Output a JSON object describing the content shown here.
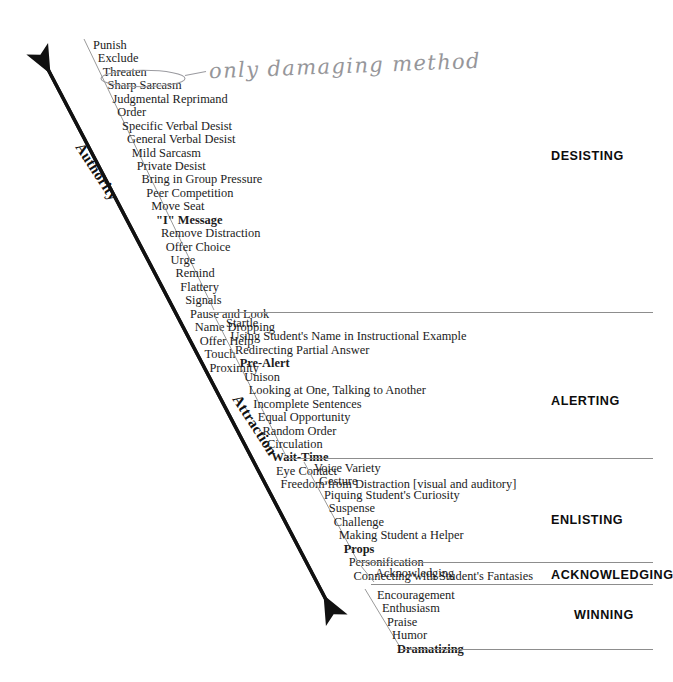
{
  "axis": {
    "top_label": "Authority",
    "bottom_label": "Attraction"
  },
  "annotation": {
    "text": "only damaging method",
    "circled_item": "Sharp Sarcasm"
  },
  "sections": [
    {
      "id": "desisting",
      "category": "DESISTING",
      "items": [
        {
          "label": "Punish",
          "bold": false
        },
        {
          "label": "Exclude",
          "bold": false
        },
        {
          "label": "Threaten",
          "bold": false
        },
        {
          "label": "Sharp Sarcasm",
          "bold": false
        },
        {
          "label": "Judgmental Reprimand",
          "bold": false
        },
        {
          "label": "Order",
          "bold": false
        },
        {
          "label": "Specific Verbal Desist",
          "bold": false
        },
        {
          "label": "General Verbal Desist",
          "bold": false
        },
        {
          "label": "Mild Sarcasm",
          "bold": false
        },
        {
          "label": "Private Desist",
          "bold": false
        },
        {
          "label": "Bring in Group Pressure",
          "bold": false
        },
        {
          "label": "Peer Competition",
          "bold": false
        },
        {
          "label": "Move Seat",
          "bold": false
        },
        {
          "label": "\"I\" Message",
          "bold": true
        },
        {
          "label": "Remove Distraction",
          "bold": false
        },
        {
          "label": "Offer Choice",
          "bold": false
        },
        {
          "label": "Urge",
          "bold": false
        },
        {
          "label": "Remind",
          "bold": false
        },
        {
          "label": "Flattery",
          "bold": false
        },
        {
          "label": "Signals",
          "bold": false
        },
        {
          "label": "Pause and Look",
          "bold": false
        },
        {
          "label": "Name Dropping",
          "bold": false
        },
        {
          "label": "Offer Help",
          "bold": false
        },
        {
          "label": "Touch",
          "bold": false
        },
        {
          "label": "Proximity",
          "bold": false
        }
      ]
    },
    {
      "id": "alerting",
      "category": "ALERTING",
      "items": [
        {
          "label": "Startle",
          "bold": false
        },
        {
          "label": "Using Student's Name in Instructional Example",
          "bold": false
        },
        {
          "label": "Redirecting Partial Answer",
          "bold": false
        },
        {
          "label": "Pre-Alert",
          "bold": true
        },
        {
          "label": "Unison",
          "bold": false
        },
        {
          "label": "Looking at One, Talking to Another",
          "bold": false
        },
        {
          "label": "Incomplete Sentences",
          "bold": false
        },
        {
          "label": "Equal Opportunity",
          "bold": false
        },
        {
          "label": "Random Order",
          "bold": false
        },
        {
          "label": "Circulation",
          "bold": false
        },
        {
          "label": "Wait-Time",
          "bold": true
        },
        {
          "label": "Eye Contact",
          "bold": false
        },
        {
          "label": "Freedom from Distraction [visual and  auditory]",
          "bold": false
        }
      ]
    },
    {
      "id": "enlisting",
      "category": "ENLISTING",
      "items": [
        {
          "label": "Voice Variety",
          "bold": false
        },
        {
          "label": "Gesture",
          "bold": false
        },
        {
          "label": "Piquing Student's Curiosity",
          "bold": false
        },
        {
          "label": "Suspense",
          "bold": false
        },
        {
          "label": "Challenge",
          "bold": false
        },
        {
          "label": "Making Student a Helper",
          "bold": false
        },
        {
          "label": "Props",
          "bold": true
        },
        {
          "label": "Personification",
          "bold": false
        },
        {
          "label": "Connecting with Student's Fantasies",
          "bold": false
        }
      ]
    },
    {
      "id": "acknowledging",
      "category": "ACKNOWLEDGING",
      "items": [
        {
          "label": "Acknowledging",
          "bold": false
        }
      ]
    },
    {
      "id": "winning",
      "category": "WINNING",
      "items": [
        {
          "label": "Encouragement",
          "bold": false
        },
        {
          "label": "Enthusiasm",
          "bold": false
        },
        {
          "label": "Praise",
          "bold": false
        },
        {
          "label": "Humor",
          "bold": false
        },
        {
          "label": "Dramatizing",
          "bold": true
        }
      ]
    }
  ]
}
